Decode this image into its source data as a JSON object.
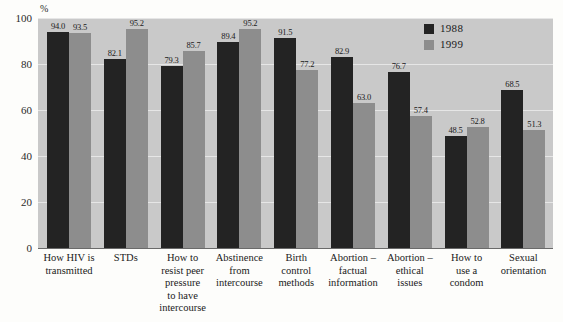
{
  "chart_data": {
    "type": "bar",
    "title": "",
    "xlabel": "",
    "ylabel": "%",
    "ylim": [
      0,
      100
    ],
    "yticks": [
      0,
      20,
      40,
      60,
      80,
      100
    ],
    "grid": true,
    "legend_position": "top-right",
    "categories": [
      "How HIV is transmitted",
      "STDs",
      "How to resist peer pressure to have intercourse",
      "Abstinence from intercourse",
      "Birth control methods",
      "Abortion – factual information",
      "Abortion – ethical issues",
      "How to use a condom",
      "Sexual orientation"
    ],
    "category_lines": [
      [
        "How HIV is",
        "transmitted"
      ],
      [
        "STDs"
      ],
      [
        "How to",
        "resist peer",
        "pressure",
        "to have",
        "intercourse"
      ],
      [
        "Abstinence",
        "from",
        "intercourse"
      ],
      [
        "Birth",
        "control",
        "methods"
      ],
      [
        "Abortion –",
        "factual",
        "information"
      ],
      [
        "Abortion –",
        "ethical",
        "issues"
      ],
      [
        "How to",
        "use a",
        "condom"
      ],
      [
        "Sexual",
        "orientation"
      ]
    ],
    "series": [
      {
        "name": "1988",
        "color": "#232323",
        "values": [
          94.0,
          82.1,
          79.3,
          89.4,
          91.5,
          82.9,
          76.7,
          48.5,
          68.5
        ],
        "labels": [
          "94.0",
          "82.1",
          "79.3",
          "89.4",
          "91.5",
          "82.9",
          "76.7",
          "48.5",
          "68.5"
        ]
      },
      {
        "name": "1999",
        "color": "#8d8d8d",
        "values": [
          93.5,
          95.2,
          85.7,
          95.2,
          77.2,
          63.0,
          57.4,
          52.8,
          51.3
        ],
        "labels": [
          "93.5",
          "95.2",
          "85.7",
          "95.2",
          "77.2",
          "63.0",
          "57.4",
          "52.8",
          "51.3"
        ]
      }
    ]
  },
  "axis": {
    "y_unit": "%",
    "y_tick_labels": [
      "100",
      "80",
      "60",
      "40",
      "20",
      "0"
    ]
  },
  "legend": {
    "items": [
      {
        "label": "1988",
        "color": "#232323"
      },
      {
        "label": "1999",
        "color": "#8d8d8d"
      }
    ]
  },
  "colors": {
    "series_1988": "#232323",
    "series_1999": "#8d8d8d",
    "plot_background": "#c9c9c9",
    "page_background": "#fdfdfb",
    "gridline": "#e6e6e6"
  }
}
